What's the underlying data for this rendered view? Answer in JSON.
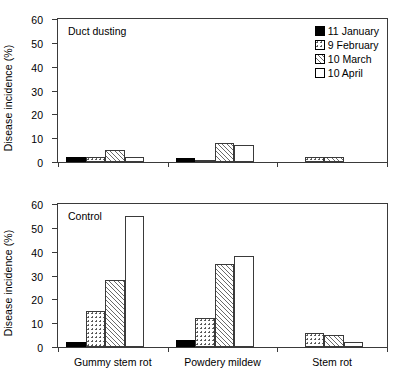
{
  "chart_data": {
    "type": "bar",
    "title": "",
    "xlabel": "",
    "ylabel": "Disease incidence (%)",
    "ylim": [
      0,
      60
    ],
    "yticks": [
      0,
      10,
      20,
      30,
      40,
      50,
      60
    ],
    "grid": false,
    "legend_position": "top-right",
    "categories": [
      "Gummy stem rot",
      "Powdery mildew",
      "Stem rot"
    ],
    "panels": [
      {
        "label": "Duct dusting",
        "ylabel": "Disease incidence (%)",
        "series": [
          {
            "name": "11 January",
            "pattern": "solid",
            "values": [
              2,
              1.5,
              0
            ]
          },
          {
            "name": "9 February",
            "pattern": "dots",
            "values": [
              2,
              0.5,
              2
            ]
          },
          {
            "name": "10 March",
            "pattern": "hatch",
            "values": [
              5,
              8,
              2
            ]
          },
          {
            "name": "10 April",
            "pattern": "empty",
            "values": [
              2,
              7,
              0
            ]
          }
        ]
      },
      {
        "label": "Control",
        "ylabel": "Disease incidence (%)",
        "series": [
          {
            "name": "11 January",
            "pattern": "solid",
            "values": [
              2,
              3,
              0
            ]
          },
          {
            "name": "9 February",
            "pattern": "dots",
            "values": [
              15,
              12,
              6
            ]
          },
          {
            "name": "10 March",
            "pattern": "hatch",
            "values": [
              28,
              35,
              5
            ]
          },
          {
            "name": "10 April",
            "pattern": "empty",
            "values": [
              55,
              38,
              2
            ]
          }
        ]
      }
    ],
    "legend": [
      {
        "label": "11 January",
        "pattern": "solid"
      },
      {
        "label": "9 February",
        "pattern": "dots"
      },
      {
        "label": "10 March",
        "pattern": "hatch"
      },
      {
        "label": "10 April",
        "pattern": "empty"
      }
    ]
  }
}
